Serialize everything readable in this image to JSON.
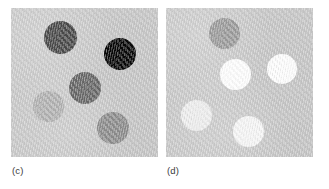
{
  "figure": {
    "background_color": "#ffffff",
    "width": 329,
    "height": 189,
    "panels": [
      {
        "id": "panel-c",
        "label": "(c)",
        "x": 11,
        "y": 8,
        "width": 147,
        "height": 149,
        "label_x": 12,
        "label_y": 166,
        "background_color": "#c9c9c9",
        "particles": [
          {
            "name": "particle-c-1",
            "tone": "dark-gray",
            "color": "#4b4b4b",
            "cx": 60,
            "cy": 37,
            "d": 33
          },
          {
            "name": "particle-c-2",
            "tone": "black",
            "color": "#090909",
            "cx": 120,
            "cy": 54,
            "d": 32
          },
          {
            "name": "particle-c-3",
            "tone": "medium-dark-gray",
            "color": "#696969",
            "cx": 85,
            "cy": 88,
            "d": 32
          },
          {
            "name": "particle-c-4",
            "tone": "light-gray",
            "color": "#b2b2b2",
            "cx": 48,
            "cy": 106,
            "d": 31
          },
          {
            "name": "particle-c-5",
            "tone": "medium-gray",
            "color": "#8d8d8d",
            "cx": 113,
            "cy": 128,
            "d": 32
          }
        ]
      },
      {
        "id": "panel-d",
        "label": "(d)",
        "x": 166,
        "y": 8,
        "width": 147,
        "height": 149,
        "label_x": 167,
        "label_y": 166,
        "background_color": "#c9c9c9",
        "particles": [
          {
            "name": "particle-d-1",
            "tone": "medium-gray",
            "color": "#9c9c9c",
            "cx": 224,
            "cy": 33,
            "d": 31
          },
          {
            "name": "particle-d-2",
            "tone": "white",
            "color": "#fdfdfd",
            "cx": 235,
            "cy": 74,
            "d": 31
          },
          {
            "name": "particle-d-3",
            "tone": "white",
            "color": "#fcfcfc",
            "cx": 282,
            "cy": 69,
            "d": 30
          },
          {
            "name": "particle-d-4",
            "tone": "off-white",
            "color": "#ededed",
            "cx": 196,
            "cy": 115,
            "d": 31
          },
          {
            "name": "particle-d-5",
            "tone": "near-white",
            "color": "#f5f5f5",
            "cx": 248,
            "cy": 131,
            "d": 31
          }
        ]
      }
    ]
  }
}
